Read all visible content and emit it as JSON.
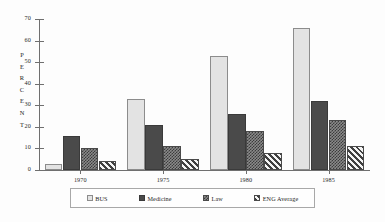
{
  "chart_data": {
    "type": "bar",
    "title": "",
    "xlabel": "",
    "ylabel": "PERCENT",
    "categories": [
      "1970",
      "1975",
      "1980",
      "1985"
    ],
    "ylim": [
      0,
      70
    ],
    "yticks": [
      0,
      10,
      20,
      30,
      40,
      50,
      60,
      70
    ],
    "grid": false,
    "legend_position": "bottom",
    "series": [
      {
        "name": "BUS",
        "values": [
          3,
          33,
          53,
          66
        ],
        "fill": "light-gray-solid"
      },
      {
        "name": "Medicine",
        "values": [
          16,
          21,
          26,
          32
        ],
        "fill": "dark-gray-solid"
      },
      {
        "name": "Law",
        "values": [
          10,
          11,
          18,
          23
        ],
        "fill": "checkered"
      },
      {
        "name": "ENG Average",
        "values": [
          4,
          5,
          8,
          11
        ],
        "fill": "diagonal-stripe"
      }
    ]
  },
  "axis": {
    "y_title_letters": [
      "P",
      "E",
      "R",
      "C",
      "E",
      "N",
      "T"
    ],
    "y_tick_labels": [
      "70",
      "60",
      "50",
      "40",
      "30",
      "20",
      "10",
      "0"
    ]
  },
  "legend": {
    "items": [
      {
        "label": "BUS"
      },
      {
        "label": "Medicine"
      },
      {
        "label": "Law"
      },
      {
        "label": "ENG Average"
      }
    ]
  },
  "colors": {
    "bus": "#e3e3e3",
    "medicine": "#4a4a4a",
    "law": "#8a8a8a",
    "eng_average": "#f2f2f2",
    "axis": "#6f6f6f",
    "text": "#1f1f1f",
    "background": "#fdfdfd"
  }
}
